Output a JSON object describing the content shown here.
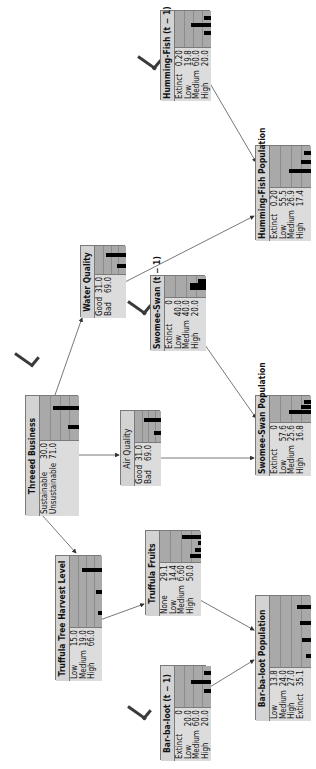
{
  "diagram": {
    "type": "bayesian-network",
    "orientation": "rotated-90-ccw",
    "colors": {
      "node_bg": "#d9d9d9",
      "chart_bg": "#a9a9a9",
      "bar": "#000000",
      "border": "#7a7a7a",
      "edge": "#444444"
    },
    "nodes": [
      {
        "id": "threeed_business",
        "title": "Threeed Business",
        "states": [
          {
            "label": "Sustainable",
            "value": "30.0"
          },
          {
            "label": "Unsustainable",
            "value": "71.0"
          }
        ]
      },
      {
        "id": "truffula_harvest",
        "title": "Truffula Tree Harvest Level",
        "states": [
          {
            "label": "Low",
            "value": "15.0"
          },
          {
            "label": "Medium",
            "value": "19.0"
          },
          {
            "label": "High",
            "value": "66.0"
          }
        ]
      },
      {
        "id": "truffula_fruits",
        "title": "Truffula Fruits",
        "states": [
          {
            "label": "None",
            "value": "29.1"
          },
          {
            "label": "Low",
            "value": "14.4"
          },
          {
            "label": "Medium",
            "value": "6.60"
          },
          {
            "label": "High",
            "value": "50.0"
          }
        ]
      },
      {
        "id": "air_quality",
        "title": "Air Quality",
        "title_bold": false,
        "states": [
          {
            "label": "Good",
            "value": "31.0"
          },
          {
            "label": "Bad",
            "value": "69.0"
          }
        ]
      },
      {
        "id": "water_quality",
        "title": "Water Quality",
        "states": [
          {
            "label": "Good",
            "value": "31.0"
          },
          {
            "label": "Bad",
            "value": "69.0"
          }
        ]
      },
      {
        "id": "swomee_prev",
        "title": "Swomee-Swan (t − 1)",
        "states": [
          {
            "label": "Extinct",
            "value": "0"
          },
          {
            "label": "Low",
            "value": "40.0"
          },
          {
            "label": "Medium",
            "value": "40.0"
          },
          {
            "label": "High",
            "value": "20.0"
          }
        ]
      },
      {
        "id": "swomee_pop",
        "title": "Swomee-Swan Population",
        "states": [
          {
            "label": "Extinct",
            "value": "0"
          },
          {
            "label": "Low",
            "value": "57.6"
          },
          {
            "label": "Medium",
            "value": "25.6"
          },
          {
            "label": "High",
            "value": "16.8"
          }
        ]
      },
      {
        "id": "humming_pop",
        "title": "Humming-Fish Population",
        "states": [
          {
            "label": "Extinct",
            "value": "0.20"
          },
          {
            "label": "Low",
            "value": "55.5"
          },
          {
            "label": "Medium",
            "value": "26.9"
          },
          {
            "label": "High",
            "value": "17.4"
          }
        ]
      },
      {
        "id": "humming_prev",
        "title": "Humming-Fish (t − 1)",
        "states": [
          {
            "label": "Extinct",
            "value": "0.20"
          },
          {
            "label": "Low",
            "value": "19.8"
          },
          {
            "label": "Medium",
            "value": "60.0"
          },
          {
            "label": "High",
            "value": "20.0"
          }
        ]
      },
      {
        "id": "barbaloot_prev",
        "title": "Bar-ba-loot (t − 1)",
        "states": [
          {
            "label": "Extinct",
            "value": "0"
          },
          {
            "label": "Low",
            "value": "20.0"
          },
          {
            "label": "Medium",
            "value": "60.0"
          },
          {
            "label": "High",
            "value": "20.0"
          }
        ]
      },
      {
        "id": "barbaloot_pop",
        "title": "Bar-ba-loot Population",
        "states": [
          {
            "label": "Low",
            "value": "13.8"
          },
          {
            "label": "Medium",
            "value": "24.0"
          },
          {
            "label": "High",
            "value": "27.0"
          },
          {
            "label": "Extinct",
            "value": "35.1"
          }
        ]
      }
    ],
    "edges": [
      {
        "from": "threeed_business",
        "to": "truffula_harvest"
      },
      {
        "from": "threeed_business",
        "to": "air_quality"
      },
      {
        "from": "threeed_business",
        "to": "water_quality"
      },
      {
        "from": "truffula_harvest",
        "to": "truffula_fruits"
      },
      {
        "from": "truffula_fruits",
        "to": "barbaloot_pop"
      },
      {
        "from": "barbaloot_prev",
        "to": "barbaloot_pop"
      },
      {
        "from": "air_quality",
        "to": "swomee_pop"
      },
      {
        "from": "swomee_prev",
        "to": "swomee_pop"
      },
      {
        "from": "water_quality",
        "to": "humming_pop"
      },
      {
        "from": "humming_prev",
        "to": "humming_pop"
      }
    ]
  }
}
